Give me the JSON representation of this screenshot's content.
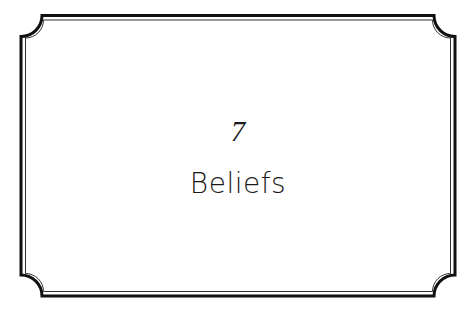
{
  "page": {
    "chapter_number": "7",
    "chapter_title": "Beliefs"
  },
  "frame": {
    "style": "double-line border with concave corners",
    "outer_line_color": "#111111",
    "inner_line_color": "#333333",
    "background": "#ffffff"
  }
}
